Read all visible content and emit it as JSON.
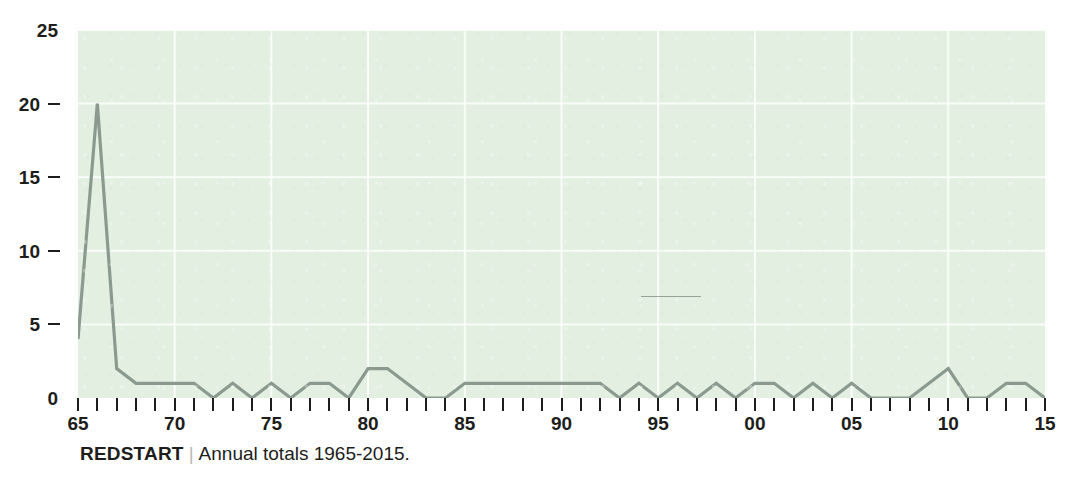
{
  "caption": {
    "species": "REDSTART",
    "separator": "|",
    "description": "Annual totals 1965-2015."
  },
  "colors": {
    "plot_background": "#e2efe1",
    "gridline": "#ffffff",
    "line": "#8a9a8f",
    "axis_text": "#1d1d1b",
    "caption_separator": "#b9b9b7"
  },
  "chart_data": {
    "type": "line",
    "title": "REDSTART",
    "subtitle": "Annual totals 1965-2015.",
    "xlabel": "",
    "ylabel": "",
    "xlim": [
      1965,
      2015
    ],
    "ylim": [
      0,
      25
    ],
    "grid": true,
    "gridlines_y": [
      0,
      5,
      10,
      15,
      20,
      25
    ],
    "gridlines_x": [
      1965,
      1970,
      1975,
      1980,
      1985,
      1990,
      1995,
      2000,
      2005,
      2010,
      2015
    ],
    "legend": null,
    "yticks": [
      0,
      5,
      10,
      15,
      20,
      25
    ],
    "ytick_labels": [
      "0",
      "5",
      "10",
      "15",
      "20",
      "25"
    ],
    "xticks": [
      1965,
      1970,
      1975,
      1980,
      1985,
      1990,
      1995,
      2000,
      2005,
      2010,
      2015
    ],
    "xtick_labels": [
      "65",
      "70",
      "75",
      "80",
      "85",
      "90",
      "95",
      "00",
      "05",
      "10",
      "15"
    ],
    "xtick_minor_every": 1,
    "x": [
      1965,
      1966,
      1967,
      1968,
      1969,
      1970,
      1971,
      1972,
      1973,
      1974,
      1975,
      1976,
      1977,
      1978,
      1979,
      1980,
      1981,
      1982,
      1983,
      1984,
      1985,
      1986,
      1987,
      1988,
      1989,
      1990,
      1991,
      1992,
      1993,
      1994,
      1995,
      1996,
      1997,
      1998,
      1999,
      2000,
      2001,
      2002,
      2003,
      2004,
      2005,
      2006,
      2007,
      2008,
      2009,
      2010,
      2011,
      2012,
      2013,
      2014,
      2015
    ],
    "values": [
      4,
      20,
      2,
      1,
      1,
      1,
      1,
      0,
      1,
      0,
      1,
      0,
      1,
      1,
      0,
      2,
      2,
      1,
      0,
      0,
      1,
      1,
      1,
      1,
      1,
      1,
      1,
      1,
      0,
      1,
      0,
      1,
      0,
      1,
      0,
      1,
      1,
      0,
      1,
      0,
      1,
      0,
      0,
      0,
      1,
      2,
      0,
      0,
      1,
      1,
      0
    ],
    "series": [
      {
        "name": "Redstart annual total",
        "color": "#8a9a8f",
        "values": [
          4,
          20,
          2,
          1,
          1,
          1,
          1,
          0,
          1,
          0,
          1,
          0,
          1,
          1,
          0,
          2,
          2,
          1,
          0,
          0,
          1,
          1,
          1,
          1,
          1,
          1,
          1,
          1,
          0,
          1,
          0,
          1,
          0,
          1,
          0,
          1,
          1,
          0,
          1,
          0,
          1,
          0,
          0,
          0,
          1,
          2,
          0,
          0,
          1,
          1,
          0
        ]
      }
    ],
    "annotations": []
  }
}
